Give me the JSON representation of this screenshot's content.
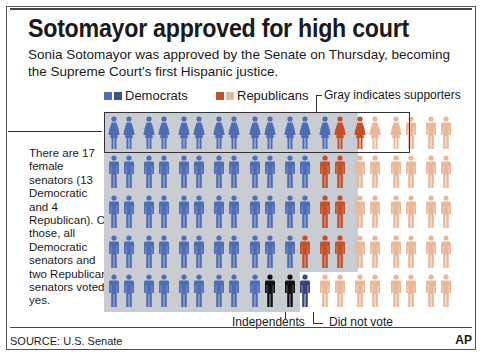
{
  "header": {
    "title": "Sotomayor approved for high court",
    "subtitle": "Sonia Sotomayor was approved by the Senate on Thursday, becoming the Supreme Court's first Hispanic justice."
  },
  "legend": {
    "democrats": "Democrats",
    "republicans": "Republicans",
    "gray_note": "Gray indicates supporters"
  },
  "sidebar_note": "There are 17 female senators (13 Democratic and 4 Republican). Of those, all Democratic senators and two Republican senators voted yes.",
  "annotations": {
    "independents": "Independents",
    "did_not_vote": "Did not vote"
  },
  "footer": {
    "source": "SOURCE: U.S. Senate",
    "credit": "AP"
  },
  "colors": {
    "dem_yes": "#4e6db5",
    "dem_dark": "#3d4f8f",
    "rep_yes": "#c4502a",
    "rep_no": "#e9b79a",
    "independent": "#111111",
    "did_not_vote": "#3a4478",
    "gray_supporters": "#c9ccd3"
  },
  "chart_data": {
    "type": "table",
    "title": "Sotomayor approved for high court",
    "subtitle": "Sonia Sotomayor was approved by the Senate on Thursday, becoming the Supreme Court's first Hispanic justice.",
    "legend": [
      "Democrats",
      "Republicans",
      "Gray indicates supporters"
    ],
    "rows": [
      {
        "row": 1,
        "figures": "13 Democratic women (yes), 2 Republican women (yes), 2 Republican women (no), 3 Republican men (no)"
      },
      {
        "row": 2,
        "figures": "12 Democrats (yes), 2 Republicans (yes), 6 Republicans (no)"
      },
      {
        "row": 3,
        "figures": "12 Democrats (yes), 2 Republicans (yes), 6 Republicans (no)"
      },
      {
        "row": 4,
        "figures": "11 Democrats (yes), 3 Republicans (yes), 6 Republicans (no)"
      },
      {
        "row": 5,
        "figures": "9 Democrats (yes), 2 Independents (yes), 1 Democrat did not vote, 8 Republicans (no)"
      }
    ],
    "totals": {
      "democrats_yes": 57,
      "independents_yes": 2,
      "republicans_yes": 9,
      "republicans_no": 31,
      "did_not_vote": 1,
      "total_yes": 68,
      "total_no": 31
    },
    "row_layout": [
      [
        "DF",
        "DF",
        "DF",
        "DF",
        "DF",
        "DF",
        "DF",
        "DF",
        "DF",
        "DF",
        "DF",
        "DF",
        "DF",
        "RFY",
        "RFY",
        "RFN",
        "RFN",
        "RMN",
        "RMN",
        "RMN"
      ],
      [
        "D",
        "D",
        "D",
        "D",
        "D",
        "D",
        "D",
        "D",
        "D",
        "D",
        "D",
        "D",
        "RY",
        "RY",
        "RN",
        "RN",
        "RN",
        "RN",
        "RN",
        "RN"
      ],
      [
        "D",
        "D",
        "D",
        "D",
        "D",
        "D",
        "D",
        "D",
        "D",
        "D",
        "D",
        "D",
        "RY",
        "RY",
        "RN",
        "RN",
        "RN",
        "RN",
        "RN",
        "RN"
      ],
      [
        "D",
        "D",
        "D",
        "D",
        "D",
        "D",
        "D",
        "D",
        "D",
        "D",
        "D",
        "RY",
        "RY",
        "RY",
        "RN",
        "RN",
        "RN",
        "RN",
        "RN",
        "RN"
      ],
      [
        "D",
        "D",
        "D",
        "D",
        "D",
        "D",
        "D",
        "D",
        "D",
        "I",
        "I",
        "DNV",
        "RN",
        "RN",
        "RN",
        "RN",
        "RN",
        "RN",
        "RN",
        "RN"
      ]
    ]
  }
}
